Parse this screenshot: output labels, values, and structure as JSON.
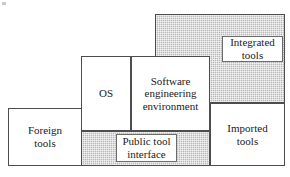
{
  "figure": {
    "type": "block-diagram",
    "width": 290,
    "height": 177,
    "background": "#ffffff",
    "shade_color": "#b8b8b8",
    "line_color": "#4d4d4d",
    "text_color": "#1a1a1a"
  },
  "blocks": [
    {
      "id": "integrated-tools-region",
      "label": "",
      "fill": "shaded",
      "x": 155,
      "y": 14,
      "w": 130,
      "h": 89
    },
    {
      "id": "integrated-tools",
      "label": "Integrated\ntools",
      "line1": "Integrated",
      "line2": "tools",
      "fill": "white",
      "x": 222,
      "y": 36,
      "w": 61,
      "h": 26
    },
    {
      "id": "os",
      "label": "OS",
      "line1": "OS",
      "line2": "",
      "fill": "white",
      "x": 81,
      "y": 56,
      "w": 50,
      "h": 75
    },
    {
      "id": "software-engineering-environment",
      "label": "Software\nengineering\nenvironment",
      "line1": "Software",
      "line2": "engineering",
      "line3": "environment",
      "fill": "white",
      "x": 131,
      "y": 56,
      "w": 79,
      "h": 75
    },
    {
      "id": "imported-tools",
      "label": "Imported\ntools",
      "line1": "Imported",
      "line2": "tools",
      "fill": "white",
      "x": 210,
      "y": 103,
      "w": 75,
      "h": 63
    },
    {
      "id": "foreign-tools",
      "label": "Foreign\ntools",
      "line1": "Foreign",
      "line2": "tools",
      "fill": "white",
      "x": 8,
      "y": 108,
      "w": 74,
      "h": 58
    },
    {
      "id": "public-tool-interface-region",
      "label": "",
      "fill": "shaded",
      "x": 81,
      "y": 131,
      "w": 129,
      "h": 35
    },
    {
      "id": "public-tool-interface",
      "label": "Public tool\ninterface",
      "line1": "Public tool",
      "line2": "interface",
      "fill": "white",
      "x": 116,
      "y": 134,
      "w": 61,
      "h": 28
    }
  ],
  "labels": {
    "integrated_tools_line1": "Integrated",
    "integrated_tools_line2": "tools",
    "os": "OS",
    "see_line1": "Software",
    "see_line2": "engineering",
    "see_line3": "environment",
    "imported_tools_line1": "Imported",
    "imported_tools_line2": "tools",
    "foreign_tools_line1": "Foreign",
    "foreign_tools_line2": "tools",
    "public_tool_interface_line1": "Public tool",
    "public_tool_interface_line2": "interface"
  }
}
